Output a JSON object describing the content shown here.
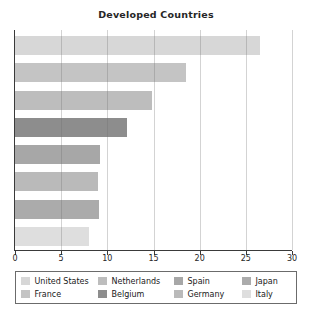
{
  "chart_data": {
    "type": "bar",
    "orientation": "horizontal",
    "title": "Developed Countries",
    "xlabel": "",
    "ylabel": "",
    "xlim": [
      0,
      30
    ],
    "xticks": [
      0,
      5,
      10,
      15,
      20,
      25,
      30
    ],
    "grid": true,
    "gridline_color": "#d4d4d4",
    "axis_color": "#3a3a3a",
    "categories": [
      "United States",
      "France",
      "Netherlands",
      "Belgium",
      "Spain",
      "Germany",
      "Japan",
      "Italy"
    ],
    "values": [
      26.5,
      18.5,
      14.8,
      12.1,
      9.2,
      9.0,
      9.1,
      8.0
    ],
    "colors": [
      "#d7d7d7",
      "#c4c4c4",
      "#bdbdbd",
      "#8d8d8d",
      "#a7a7a7",
      "#bababa",
      "#ababab",
      "#dedede"
    ],
    "legend": {
      "position": "bottom",
      "border_color": "#6b6b6b",
      "display_order": [
        "United States",
        "Netherlands",
        "Spain",
        "Japan",
        "France",
        "Belgium",
        "Germany",
        "Italy"
      ]
    }
  }
}
